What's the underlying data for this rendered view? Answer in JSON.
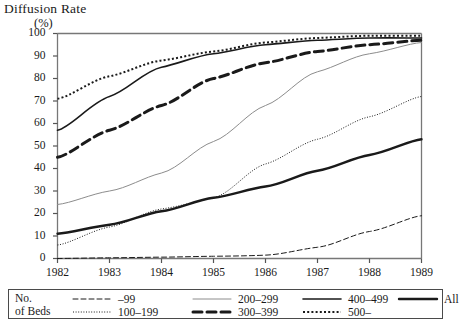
{
  "title": {
    "main": "Diffusion Rate",
    "unit": "(%)"
  },
  "legend": {
    "title_line1": "No.",
    "title_line2": "of Beds",
    "items": [
      {
        "label": "–99",
        "style": "dashed-thin",
        "color": "#1a1a1a"
      },
      {
        "label": "100–199",
        "style": "dotted-fine",
        "color": "#1a1a1a"
      },
      {
        "label": "200–299",
        "style": "solid-thin",
        "color": "#8c8c8c"
      },
      {
        "label": "300–399",
        "style": "dashed-thick",
        "color": "#1a1a1a"
      },
      {
        "label": "400–499",
        "style": "solid-medium",
        "color": "#1a1a1a"
      },
      {
        "label": "500–",
        "style": "dotted-coarse",
        "color": "#1a1a1a"
      },
      {
        "label": "All",
        "style": "solid-thick",
        "color": "#1a1a1a"
      }
    ]
  },
  "chart_data": {
    "type": "line",
    "title": "Diffusion Rate (%)",
    "xlabel": "",
    "ylabel": "Diffusion Rate (%)",
    "x": [
      1982,
      1983,
      1984,
      1985,
      1986,
      1987,
      1988,
      1989
    ],
    "xtick_labels": [
      "1982",
      "1983",
      "1984",
      "1985",
      "1986",
      "1987",
      "1988",
      "1989"
    ],
    "ytick_labels": [
      "0",
      "10",
      "20",
      "30",
      "40",
      "50",
      "60",
      "70",
      "80",
      "90",
      "100"
    ],
    "xlim": [
      1982,
      1989
    ],
    "ylim": [
      0,
      100
    ],
    "ytick_step": 10,
    "grid": false,
    "legend_position": "below-plot",
    "series": [
      {
        "name": "–99",
        "style": "dashed-thin",
        "color": "#1a1a1a",
        "width": 1.0,
        "values": [
          0,
          0.3,
          0.6,
          1,
          1.5,
          5,
          12,
          19
        ]
      },
      {
        "name": "100–199",
        "style": "dotted-fine",
        "color": "#1a1a1a",
        "width": 1.0,
        "values": [
          6,
          14,
          22,
          27,
          42,
          53,
          63,
          72
        ]
      },
      {
        "name": "200–299",
        "style": "solid-thin",
        "color": "#8c8c8c",
        "width": 1.0,
        "values": [
          24,
          30,
          38,
          52,
          68,
          83,
          91,
          96
        ]
      },
      {
        "name": "300–399",
        "style": "dashed-thick",
        "color": "#1a1a1a",
        "width": 3.0,
        "values": [
          45,
          57,
          68,
          80,
          87,
          92,
          95,
          97
        ]
      },
      {
        "name": "400–499",
        "style": "solid-medium",
        "color": "#1a1a1a",
        "width": 1.6,
        "values": [
          57,
          72,
          85,
          91,
          95,
          97,
          98,
          98
        ]
      },
      {
        "name": "500–",
        "style": "dotted-coarse",
        "color": "#1a1a1a",
        "width": 2.0,
        "values": [
          71,
          81,
          88,
          92,
          96,
          98,
          99,
          99
        ]
      },
      {
        "name": "All",
        "style": "solid-thick",
        "color": "#1a1a1a",
        "width": 2.4,
        "values": [
          11,
          15,
          21,
          27,
          32,
          39,
          46,
          53
        ]
      }
    ]
  }
}
